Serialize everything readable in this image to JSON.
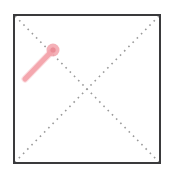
{
  "scene": {
    "title": "Drag Gesture Overlay",
    "canvas_width": 172,
    "canvas_height": 178,
    "background_color": "#ffffff"
  },
  "frame": {
    "name": "bounding-box",
    "x": 14,
    "y": 15,
    "width": 146,
    "height": 148,
    "stroke_color": "#3a3a3c",
    "stroke_width": 2,
    "fill_color": "#ffffff"
  },
  "guides": {
    "style": "dotted",
    "dot_color": "#9a9a9a",
    "dot_size": 1.6,
    "dash_pattern": "1.6 4.4",
    "stroke_width": 1.6,
    "lines": [
      {
        "name": "diagonal-top-left-to-bottom-right",
        "x1": 15,
        "y1": 16,
        "x2": 159,
        "y2": 162
      },
      {
        "name": "diagonal-top-right-to-bottom-left",
        "x1": 159,
        "y1": 16,
        "x2": 15,
        "y2": 162
      }
    ],
    "intersection": {
      "x": 87,
      "y": 89
    }
  },
  "gesture": {
    "name": "drag-stroke",
    "color": "#f4a7ae",
    "color_light": "#f8c3c8",
    "line_width": 5,
    "start": {
      "x": 25,
      "y": 79
    },
    "end": {
      "x": 53,
      "y": 50
    },
    "handle": {
      "name": "drag-endpoint-handle",
      "cx": 53,
      "cy": 50,
      "radius": 6.5,
      "fill_color": "#f2a3ab",
      "inner_radius": 2.6,
      "inner_fill_color": "#ea8d97"
    }
  },
  "labels": {
    "frame_label": "",
    "gesture_label": "",
    "center_label": ""
  }
}
